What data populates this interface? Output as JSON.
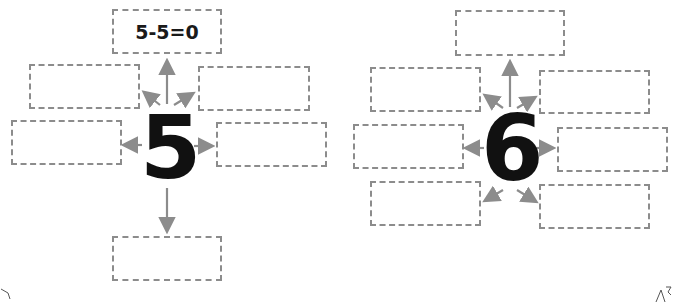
{
  "worksheet": {
    "left_diagram": {
      "center_number": "5",
      "boxes": [
        {
          "position": "top",
          "text": "5-5=0"
        },
        {
          "position": "upper-left",
          "text": ""
        },
        {
          "position": "upper-right",
          "text": ""
        },
        {
          "position": "left",
          "text": ""
        },
        {
          "position": "right",
          "text": ""
        },
        {
          "position": "bottom",
          "text": ""
        }
      ]
    },
    "right_diagram": {
      "center_number": "6",
      "boxes": [
        {
          "position": "top",
          "text": ""
        },
        {
          "position": "upper-left",
          "text": ""
        },
        {
          "position": "upper-right",
          "text": ""
        },
        {
          "position": "left",
          "text": ""
        },
        {
          "position": "right",
          "text": ""
        },
        {
          "position": "lower-left",
          "text": ""
        },
        {
          "position": "lower-right",
          "text": ""
        }
      ]
    },
    "colors": {
      "box_border": "#8c8c8c",
      "arrow": "#8c8c8c",
      "number": "#111111"
    }
  }
}
